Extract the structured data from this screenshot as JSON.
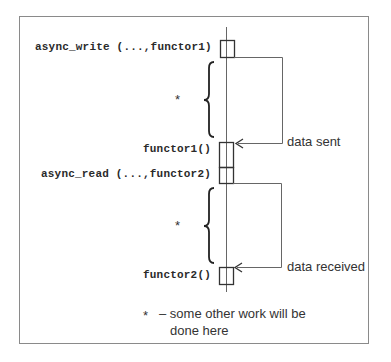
{
  "diagram": {
    "calls": [
      {
        "label": "async_write (...,functor1)"
      },
      {
        "label": "functor1()"
      },
      {
        "label": "async_read (...,functor2)"
      },
      {
        "label": "functor2()"
      }
    ],
    "work_markers": [
      "*",
      "*"
    ],
    "return_labels": [
      "data sent",
      "data received"
    ],
    "legend": {
      "symbol": "*",
      "text_line1": "– some other work will be",
      "text_line2": "done here"
    },
    "colors": {
      "frame": "#8a8a8a",
      "line": "#555555",
      "box": "#333333",
      "text": "#333333"
    }
  }
}
